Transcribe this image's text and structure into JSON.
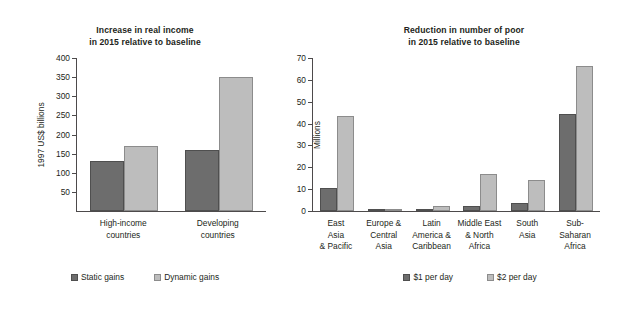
{
  "figure": {
    "background": "#ffffff",
    "series_colors": {
      "series1": "#6d6d6d",
      "series2": "#bdbdbd"
    }
  },
  "chart_data": [
    {
      "type": "bar",
      "title": "Increase in real income in 2015 relative to baseline",
      "title_lines": [
        "Increase in real income",
        "in 2015 relative to baseline"
      ],
      "xlabel": "",
      "ylabel": "1997 US$ billions",
      "ylim": [
        0,
        400
      ],
      "yticks": [
        50,
        100,
        150,
        200,
        250,
        300,
        350,
        400
      ],
      "ytick_labels": [
        "50",
        "100",
        "150",
        "200",
        "250",
        "300",
        "350",
        "400"
      ],
      "grid": false,
      "legend_position": "bottom",
      "categories": [
        "High-income countries",
        "Developing countries"
      ],
      "category_lines": [
        [
          "High-income",
          "countries"
        ],
        [
          "Developing",
          "countries"
        ]
      ],
      "series": [
        {
          "name": "Static gains",
          "color": "#6d6d6d",
          "values": [
            132,
            159
          ]
        },
        {
          "name": "Dynamic gains",
          "color": "#bdbdbd",
          "values": [
            169,
            350
          ]
        }
      ]
    },
    {
      "type": "bar",
      "title": "Reduction in number of poor in 2015 relative to baseline",
      "title_lines": [
        "Reduction in number of poor",
        "in 2015 relative to baseline"
      ],
      "xlabel": "",
      "ylabel": "Millions",
      "ylim": [
        0,
        70
      ],
      "yticks": [
        0,
        10,
        20,
        30,
        40,
        50,
        60,
        70
      ],
      "ytick_labels": [
        "0",
        "10",
        "20",
        "30",
        "40",
        "50",
        "60",
        "70"
      ],
      "grid": false,
      "legend_position": "bottom",
      "categories": [
        "East Asia & Pacific",
        "Europe & Central Asia",
        "Latin America & Caribbean",
        "Middle East & North Africa",
        "South Asia",
        "Sub-Saharan Africa"
      ],
      "category_lines": [
        [
          "East",
          "Asia",
          "& Pacific"
        ],
        [
          "Europe &",
          "Central",
          "Asia"
        ],
        [
          "Latin",
          "America &",
          "Caribbean"
        ],
        [
          "Middle East",
          "& North",
          "Africa"
        ],
        [
          "South",
          "Asia"
        ],
        [
          "Sub-",
          "Saharan",
          "Africa"
        ]
      ],
      "series": [
        {
          "name": "$1 per day",
          "color": "#6d6d6d",
          "values": [
            10.4,
            0.2,
            0.9,
            2.4,
            3.5,
            44.5
          ]
        },
        {
          "name": "$2 per day",
          "color": "#bdbdbd",
          "values": [
            43.4,
            0.8,
            2.1,
            17.0,
            14.1,
            66.4
          ]
        }
      ]
    }
  ]
}
